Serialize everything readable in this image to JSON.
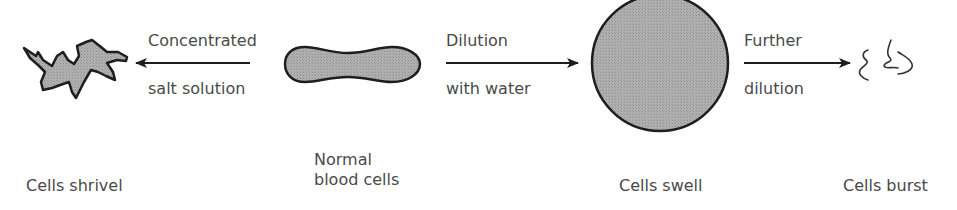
{
  "diagram": {
    "colors": {
      "cell_fill": "#a9a9a9",
      "outline": "#1e1e1e",
      "text": "#4a4a4a"
    },
    "stages": [
      {
        "id": "shrivel",
        "label": "Cells shrivel"
      },
      {
        "id": "normal",
        "label_line1": "Normal",
        "label_line2": "blood cells"
      },
      {
        "id": "swell",
        "label": "Cells swell"
      },
      {
        "id": "burst",
        "label": "Cells burst"
      }
    ],
    "arrows": [
      {
        "direction": "left",
        "label_top": "Concentrated",
        "label_bottom": "salt solution"
      },
      {
        "direction": "right",
        "label_top": "Dilution",
        "label_bottom": "with water"
      },
      {
        "direction": "right",
        "label_top": "Further",
        "label_bottom": "dilution"
      }
    ]
  }
}
